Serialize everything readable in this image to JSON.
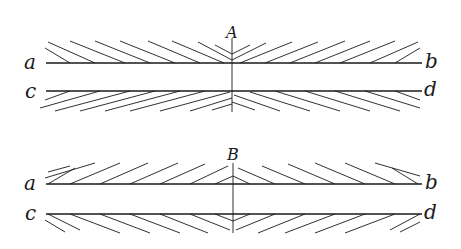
{
  "figures": [
    {
      "id": "A",
      "label": "A",
      "line_labels": {
        "top_left": "a",
        "top_right": "b",
        "bottom_left": "c",
        "bottom_right": "d"
      },
      "pattern": "hatching converges toward center (lines slope toward the vertical axis from outside)"
    },
    {
      "id": "B",
      "label": "B",
      "line_labels": {
        "top_left": "a",
        "top_right": "b",
        "bottom_left": "c",
        "bottom_right": "d"
      },
      "pattern": "hatching diverges from center (lines slope away from the vertical axis)"
    }
  ],
  "colors": {
    "ink": "#1a1a1a",
    "background": "#ffffff"
  }
}
